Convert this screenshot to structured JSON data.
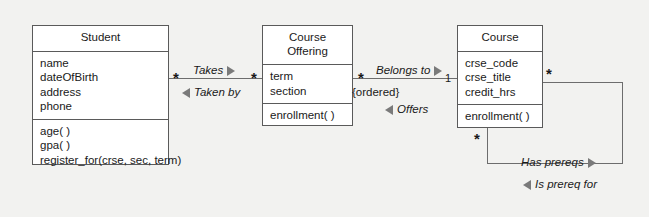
{
  "diagram": {
    "type": "uml-class-diagram",
    "background_color": "#f2f2f0",
    "box_fill_color": "#ffffff",
    "line_color": "#6d6d6d",
    "classes": [
      {
        "name": "Student",
        "attributes": [
          "name",
          "dateOfBirth",
          "address",
          "phone"
        ],
        "operations": [
          "age( )",
          "gpa( )",
          "register_for(crse, sec, term)"
        ]
      },
      {
        "name": "Course\nOffering",
        "name_line1": "Course",
        "name_line2": "Offering",
        "attributes": [
          "term",
          "section"
        ],
        "operations": [
          "enrollment( )"
        ]
      },
      {
        "name": "Course",
        "attributes": [
          "crse_code",
          "crse_title",
          "credit_hrs"
        ],
        "operations": [
          "enrollment( )"
        ]
      }
    ],
    "associations": [
      {
        "id": "student-courseoffering",
        "forward_label": "Takes",
        "forward_direction": "right",
        "reverse_label": "Taken by",
        "reverse_direction": "left",
        "source_multiplicity": "*",
        "target_multiplicity": "*"
      },
      {
        "id": "courseoffering-course",
        "forward_label": "Belongs to",
        "forward_direction": "right",
        "reverse_label": "Offers",
        "reverse_direction": "left",
        "source_multiplicity": "*",
        "target_multiplicity": "1",
        "constraint": "{ordered}"
      },
      {
        "id": "course-course-prereq",
        "forward_label": "Has prereqs",
        "forward_direction": "right",
        "reverse_label": "Is prereq for",
        "reverse_direction": "left",
        "source_multiplicity": "*",
        "target_multiplicity": "*"
      }
    ]
  }
}
